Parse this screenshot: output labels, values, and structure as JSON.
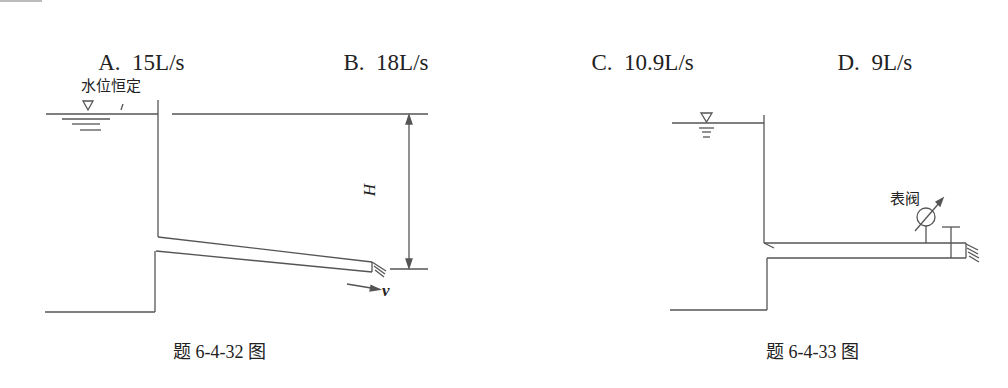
{
  "options": [
    {
      "letter": "A.",
      "value": "15L/s"
    },
    {
      "letter": "B.",
      "value": "18L/s"
    },
    {
      "letter": "C.",
      "value": "10.9L/s"
    },
    {
      "letter": "D.",
      "value": "9L/s"
    }
  ],
  "figure_left": {
    "label_water_level": "水位恒定",
    "dimension_label": "H",
    "velocity_label": "v",
    "caption": "题 6-4-32 图"
  },
  "figure_right": {
    "gauge_valve_label": "表阀",
    "caption": "题 6-4-33 图"
  },
  "colors": {
    "line": "#555555",
    "text": "#222222",
    "background": "#ffffff"
  }
}
